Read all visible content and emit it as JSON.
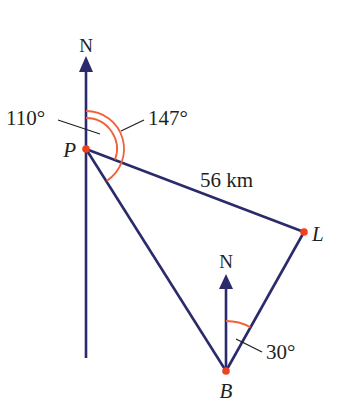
{
  "diagram": {
    "colors": {
      "line": "#2b2a6b",
      "arc": "#f0623a",
      "point": "#f0411f",
      "text": "#231f20"
    },
    "points": {
      "P": {
        "label": "P",
        "x": 86,
        "y": 149
      },
      "L": {
        "label": "L",
        "x": 304,
        "y": 232
      },
      "B": {
        "label": "B",
        "x": 226,
        "y": 371
      }
    },
    "north_labels": {
      "at_P": "N",
      "at_B": "N"
    },
    "distance_label": "56 km",
    "angles": {
      "P_to_L_bearing": "110°",
      "P_to_B_bearing": "147°",
      "B_to_L_bearing": "30°"
    }
  }
}
